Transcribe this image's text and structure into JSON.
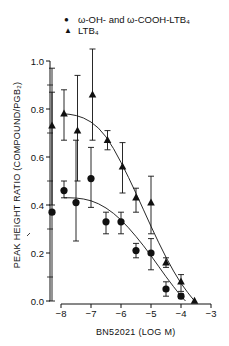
{
  "chart_data": {
    "type": "scatter",
    "title": "",
    "xlabel": "BN52021 (LOG M)",
    "ylabel": "PEAK HEIGHT RATIO (COMPOUND/PGB2)",
    "ylabel_display": "PEAK HEIGHT RATIO (COMPOUND/PGB₂)",
    "xlim": [
      -8.35,
      -3
    ],
    "ylim": [
      0,
      1.0
    ],
    "xticks": [
      -8,
      -7,
      -6,
      -5,
      -4,
      -3
    ],
    "xtick_labels": [
      "−8",
      "−7",
      "−6",
      "−5",
      "−4",
      "−3"
    ],
    "yticks": [
      0.0,
      0.2,
      0.4,
      0.6,
      0.8,
      1.0
    ],
    "ytick_labels": [
      "0.0",
      "0.2",
      "0.4",
      "0.6",
      "0.8",
      "1.0"
    ],
    "y_minor_ticks": [
      0.1,
      0.3,
      0.5,
      0.7,
      0.9
    ],
    "grid": false,
    "legend_position": "top",
    "series": [
      {
        "name": "ω-OH- and ω-COOH-LTB4",
        "legend_label": "ω-OH- and ω-COOH-LTB₄",
        "marker": "circle",
        "x": [
          -8.3,
          -7.9,
          -7.5,
          -7.0,
          -6.5,
          -6.0,
          -5.5,
          -5.0,
          -4.5,
          -4.0
        ],
        "values": [
          0.37,
          0.46,
          0.41,
          0.51,
          0.33,
          0.33,
          0.21,
          0.2,
          0.05,
          0.02
        ],
        "err_high": [
          0.87,
          0.5,
          0.67,
          0.64,
          0.37,
          0.37,
          0.24,
          0.26,
          0.08,
          0.03
        ],
        "err_low": [
          0.0,
          0.43,
          0.25,
          0.39,
          0.28,
          0.28,
          0.18,
          0.13,
          0.02,
          0.01
        ],
        "fit_curve": [
          [
            -7.9,
            0.43
          ],
          [
            -7.5,
            0.43
          ],
          [
            -7.0,
            0.42
          ],
          [
            -6.5,
            0.39
          ],
          [
            -6.0,
            0.34
          ],
          [
            -5.5,
            0.27
          ],
          [
            -5.0,
            0.19
          ],
          [
            -4.5,
            0.1
          ],
          [
            -4.0,
            0.02
          ],
          [
            -3.85,
            0.0
          ]
        ]
      },
      {
        "name": "LTB4",
        "legend_label": "LTB₄",
        "marker": "triangle",
        "x": [
          -8.3,
          -7.9,
          -7.45,
          -6.95,
          -6.45,
          -5.95,
          -5.5,
          -5.0,
          -4.5,
          -4.0,
          -3.55
        ],
        "values": [
          0.73,
          0.78,
          0.71,
          0.86,
          0.67,
          0.56,
          0.43,
          0.41,
          0.16,
          0.08,
          0.0
        ],
        "err_high": [
          0.97,
          0.88,
          0.94,
          1.05,
          0.71,
          0.66,
          0.47,
          0.52,
          0.18,
          0.11,
          0.0
        ],
        "err_low": [
          0.4,
          0.67,
          0.5,
          0.67,
          0.63,
          0.45,
          0.37,
          0.28,
          0.14,
          0.04,
          0.0
        ],
        "fit_curve": [
          [
            -7.9,
            0.78
          ],
          [
            -7.5,
            0.775
          ],
          [
            -7.0,
            0.75
          ],
          [
            -6.5,
            0.69
          ],
          [
            -6.0,
            0.58
          ],
          [
            -5.5,
            0.45
          ],
          [
            -5.0,
            0.31
          ],
          [
            -4.5,
            0.18
          ],
          [
            -4.0,
            0.07
          ],
          [
            -3.55,
            0.0
          ]
        ]
      }
    ]
  },
  "legend": {
    "items": [
      {
        "symbol": "●",
        "label": "ω-OH- and ω-COOH-LTB₄"
      },
      {
        "symbol": "▲",
        "label": "LTB₄"
      }
    ]
  },
  "axes": {
    "xlabel": "BN52021 (LOG M)",
    "ylabel": "PEAK HEIGHT RATIO (COMPOUND/PGB₂)"
  },
  "colors": {
    "ink": "#111111",
    "background": "#ffffff"
  }
}
